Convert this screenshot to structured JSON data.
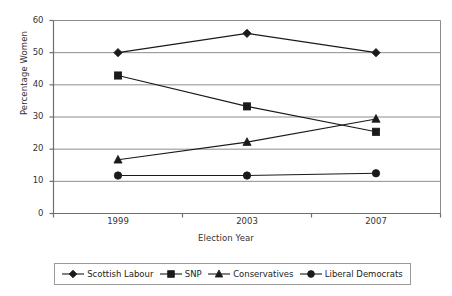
{
  "chart_data": {
    "type": "line",
    "title": "",
    "xlabel": "Election Year",
    "ylabel": "Percentage Women",
    "categories": [
      "1999",
      "2003",
      "2007"
    ],
    "x": [
      1999,
      2003,
      2007
    ],
    "ylim": [
      0,
      60
    ],
    "ytick_labels": [
      "0",
      "10",
      "20",
      "30",
      "40",
      "50",
      "60"
    ],
    "ytick_values": [
      0,
      10,
      20,
      30,
      40,
      50,
      60
    ],
    "grid": "horizontal",
    "legend_position": "bottom",
    "series": [
      {
        "name": "Scottish Labour",
        "marker": "diamond",
        "color": "#1a1a1a",
        "values": [
          50.0,
          56.0,
          50.0
        ]
      },
      {
        "name": "SNP",
        "marker": "square",
        "color": "#1a1a1a",
        "values": [
          42.9,
          33.3,
          25.4
        ]
      },
      {
        "name": "Conservatives",
        "marker": "triangle",
        "color": "#1a1a1a",
        "values": [
          16.7,
          22.2,
          29.4
        ]
      },
      {
        "name": "Liberal Democrats",
        "marker": "circle",
        "color": "#1a1a1a",
        "values": [
          11.8,
          11.8,
          12.5
        ]
      }
    ]
  },
  "colors": {
    "series": "#1a1a1a",
    "grid": "#8c8c8c",
    "axis": "#6f6f6f",
    "legend_border": "#9a9a9a",
    "text": "#333333",
    "background": "#ffffff"
  },
  "legend": {
    "items": [
      {
        "label": "Scottish Labour",
        "marker": "diamond"
      },
      {
        "label": "SNP",
        "marker": "square"
      },
      {
        "label": "Conservatives",
        "marker": "triangle"
      },
      {
        "label": "Liberal Democrats",
        "marker": "circle"
      }
    ]
  }
}
